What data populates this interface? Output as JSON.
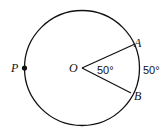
{
  "diagram": {
    "type": "circle-central-angle",
    "points": {
      "center": "O",
      "point_on_circle": "P",
      "arc_endpoint_1": "A",
      "arc_endpoint_2": "B"
    },
    "angle_label": "50°",
    "arc_label": "50°"
  }
}
